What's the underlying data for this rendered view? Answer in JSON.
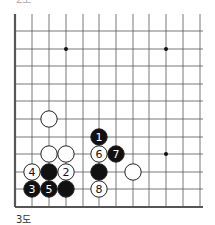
{
  "diagram": {
    "top_label": "2도",
    "caption": "3도",
    "grid": {
      "columns_x": [
        15,
        32,
        49,
        66,
        83,
        99,
        116,
        133,
        149,
        166,
        183,
        200
      ],
      "rows_y": [
        31,
        49,
        66,
        84,
        101,
        119,
        137,
        154,
        172,
        189,
        207
      ],
      "top_y": 14,
      "left_edge": true,
      "bottom_edge": true
    },
    "star_points": [
      {
        "col": 3,
        "row": 1
      },
      {
        "col": 9,
        "row": 1
      },
      {
        "col": 9,
        "row": 7
      }
    ],
    "stones": [
      {
        "color": "white",
        "col": 2,
        "row": 5,
        "label": ""
      },
      {
        "color": "black",
        "col": 5,
        "row": 6,
        "label": "1"
      },
      {
        "color": "white",
        "col": 2,
        "row": 7,
        "label": ""
      },
      {
        "color": "white",
        "col": 3,
        "row": 7,
        "label": ""
      },
      {
        "color": "white",
        "col": 5,
        "row": 7,
        "label": "6"
      },
      {
        "color": "black",
        "col": 6,
        "row": 7,
        "label": "7"
      },
      {
        "color": "white",
        "col": 1,
        "row": 8,
        "label": "4"
      },
      {
        "color": "black",
        "col": 2,
        "row": 8,
        "label": ""
      },
      {
        "color": "white",
        "col": 3,
        "row": 8,
        "label": "2"
      },
      {
        "color": "black",
        "col": 5,
        "row": 8,
        "label": ""
      },
      {
        "color": "white",
        "col": 7,
        "row": 8,
        "label": ""
      },
      {
        "color": "black",
        "col": 1,
        "row": 9,
        "label": "3"
      },
      {
        "color": "black",
        "col": 2,
        "row": 9,
        "label": "5"
      },
      {
        "color": "black",
        "col": 3,
        "row": 9,
        "label": ""
      },
      {
        "color": "white",
        "col": 5,
        "row": 9,
        "label": "8"
      }
    ]
  }
}
